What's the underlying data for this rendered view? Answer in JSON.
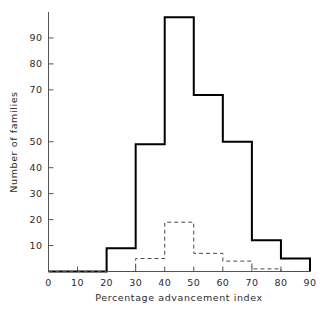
{
  "chart_data": {
    "type": "bar",
    "title": "",
    "subtitle": "",
    "xlabel": "Percentage advancement index",
    "ylabel": "Number of families",
    "xlim": [
      0,
      90
    ],
    "ylim": [
      0,
      100
    ],
    "grid": false,
    "legend": "none",
    "bin_width": 10,
    "bin_edges": [
      0,
      10,
      20,
      30,
      40,
      50,
      60,
      70,
      80,
      90
    ],
    "x_ticks": [
      0,
      10,
      20,
      30,
      40,
      50,
      60,
      70,
      80,
      90
    ],
    "x_tick_labels": [
      "0",
      "10",
      "20",
      "30",
      "40",
      "50",
      "60",
      "70",
      "80",
      "90"
    ],
    "y_ticks": [
      10,
      20,
      30,
      40,
      50,
      70,
      80,
      90
    ],
    "y_tick_labels": [
      "10",
      "20",
      "30",
      "40",
      "50",
      "70",
      "80",
      "90"
    ],
    "categories": [
      "0-10",
      "10-20",
      "20-30",
      "30-40",
      "40-50",
      "50-60",
      "60-70",
      "70-80",
      "80-90"
    ],
    "series": [
      {
        "name": "solid-histogram",
        "style": "solid",
        "color": "#000000",
        "line_width": 2,
        "values": [
          0,
          0,
          9,
          49,
          98,
          68,
          50,
          12,
          5
        ]
      },
      {
        "name": "dashed-histogram",
        "style": "dashed",
        "color": "#4a4a4a",
        "line_width": 1,
        "values": [
          0,
          0,
          0,
          5,
          19,
          7,
          4,
          1,
          0
        ]
      }
    ]
  },
  "axes": {
    "x_title": "Percentage advancement index",
    "y_title": "Number of families"
  },
  "colors": {
    "axis": "#555555",
    "solid_series": "#000000",
    "dashed_series": "#4a4a4a",
    "text": "#2b2b2b",
    "background": "#ffffff"
  }
}
